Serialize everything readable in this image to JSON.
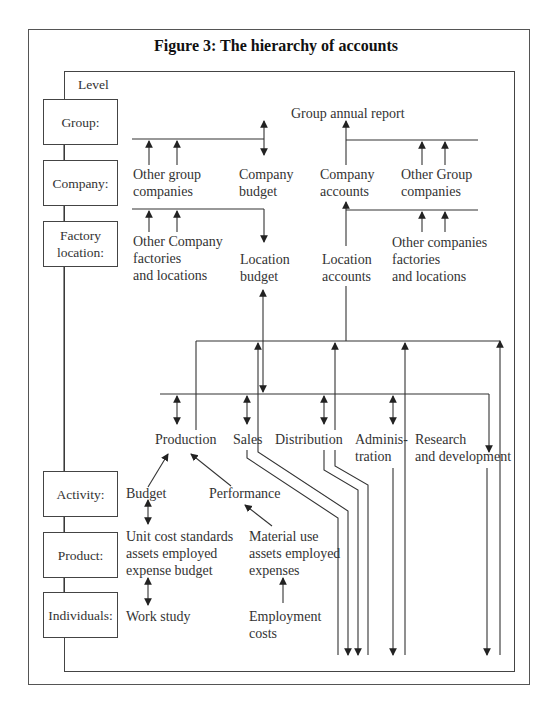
{
  "figure": {
    "title": "Figure 3: The hierarchy of accounts",
    "level_heading": "Level"
  },
  "levels": [
    {
      "label": "Group:"
    },
    {
      "label": "Company:"
    },
    {
      "label": "Factory\nlocation:"
    },
    {
      "label": "Activity:"
    },
    {
      "label": "Product:"
    },
    {
      "label": "Individuals:"
    }
  ],
  "nodes": {
    "group_annual_report": "Group annual report",
    "other_group_companies_left": "Other group\ncompanies",
    "company_budget": "Company\nbudget",
    "company_accounts": "Company\naccounts",
    "other_group_companies_right": "Other Group\ncompanies",
    "other_company_factories": "Other Company\nfactories\nand locations",
    "location_budget": "Location\nbudget",
    "location_accounts": "Location\naccounts",
    "other_companies_factories": "Other companies\nfactories\nand locations",
    "activities": [
      {
        "label": "Production"
      },
      {
        "label": "Sales"
      },
      {
        "label": "Distribution"
      },
      {
        "label": "Adminis-\ntration"
      },
      {
        "label": "Research\nand development"
      }
    ],
    "budget": "Budget",
    "performance": "Performance",
    "unit_cost_standards": "Unit cost standards\nassets employed\nexpense budget",
    "material_use": "Material use\nassets employed\nexpenses",
    "work_study": "Work study",
    "employment_costs": "Employment\ncosts"
  },
  "colors": {
    "line": "#333333",
    "text": "#333333",
    "background": "#ffffff"
  }
}
